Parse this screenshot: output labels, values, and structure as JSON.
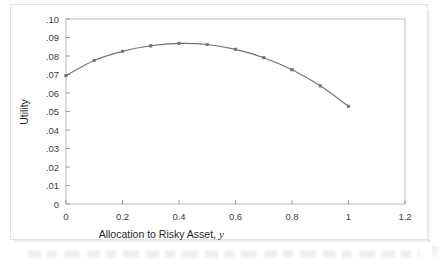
{
  "chart_data": {
    "type": "line",
    "title": "",
    "xlabel": "Allocation to Risky Asset, y",
    "xlabel_main": "Allocation to Risky Asset,",
    "xlabel_italic_symbol": "y",
    "ylabel": "Utility",
    "xlim": [
      0,
      1.2
    ],
    "ylim": [
      0,
      0.1
    ],
    "grid": false,
    "legend": null,
    "marker": "square",
    "line_color": "#6e7178",
    "marker_color": "#6e7178",
    "x": [
      0,
      0.1,
      0.2,
      0.3,
      0.4,
      0.5,
      0.6,
      0.7,
      0.8,
      0.9,
      1.0
    ],
    "values": [
      0.0694,
      0.0776,
      0.0825,
      0.0855,
      0.0868,
      0.0862,
      0.0836,
      0.0791,
      0.0726,
      0.0639,
      0.0528
    ],
    "series": [
      {
        "name": "Utility",
        "values": [
          0.0694,
          0.0776,
          0.0825,
          0.0855,
          0.0868,
          0.0862,
          0.0836,
          0.0791,
          0.0726,
          0.0639,
          0.0528
        ]
      }
    ],
    "xticks": [
      0,
      0.2,
      0.4,
      0.6,
      0.8,
      1.0,
      1.2
    ],
    "xtick_labels": [
      "0",
      "0.2",
      "0.4",
      "0.6",
      "0.8",
      "1",
      "1.2"
    ],
    "yticks": [
      0,
      0.01,
      0.02,
      0.03,
      0.04,
      0.05,
      0.06,
      0.07,
      0.08,
      0.09,
      0.1
    ],
    "ytick_labels": [
      "0",
      ".01",
      ".02",
      ".03",
      ".04",
      ".05",
      ".06",
      ".07",
      ".08",
      ".09",
      ".10"
    ],
    "annotations": []
  }
}
